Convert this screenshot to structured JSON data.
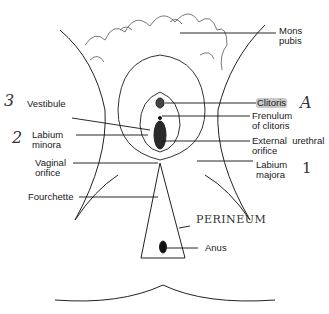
{
  "diagram": {
    "labels": [
      {
        "id": "mons-pubis",
        "text": "Mons\npubis"
      },
      {
        "id": "vestibule",
        "text": "Vestibule"
      },
      {
        "id": "clitoris",
        "text": "Clitoris"
      },
      {
        "id": "frenulum",
        "text": "Frenulum\nof clitoris"
      },
      {
        "id": "labium-minora",
        "text": "Labium\nminora"
      },
      {
        "id": "urethral-orifice",
        "text": "External  urethral\norifice"
      },
      {
        "id": "vaginal-orifice",
        "text": "Vaginal\norifice"
      },
      {
        "id": "labium-majora",
        "text": "Labium\nmajora"
      },
      {
        "id": "fourchette",
        "text": "Fourchette"
      },
      {
        "id": "anus",
        "text": "Anus"
      }
    ],
    "handwritten": {
      "n3": "3",
      "n2": "2",
      "n1": "1",
      "a": "A",
      "perineum": "PERINEUM"
    }
  }
}
